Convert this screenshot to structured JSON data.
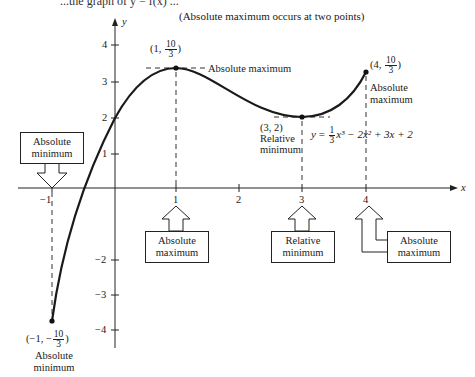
{
  "caption_cropped": "...the graph of y = f(x) ...",
  "note": "(Absolute maximum occurs at two points)",
  "axes": {
    "x_label": "x",
    "y_label": "y",
    "x_ticks": [
      "−1",
      "1",
      "2",
      "3",
      "4"
    ],
    "y_ticks": [
      "4",
      "3",
      "2",
      "1",
      "−2",
      "−3",
      "−4"
    ]
  },
  "equation": {
    "lhs": "y",
    "eq": "=",
    "coef_num": "1",
    "coef_den": "3",
    "rest": "x³ − 2x² + 3x + 2"
  },
  "points": [
    {
      "id": "left-endpoint",
      "x_text": "(−1, −",
      "num": "10",
      "den": "3",
      "close": ")",
      "label1": "Absolute",
      "label2": "minimum"
    },
    {
      "id": "local-max",
      "x_text": "(1, ",
      "num": "10",
      "den": "3",
      "close": ")",
      "label": "Absolute maximum"
    },
    {
      "id": "local-min",
      "coord": "(3, 2)",
      "label1": "Relative",
      "label2": "minimum"
    },
    {
      "id": "right-endpoint",
      "x_text": "(4, ",
      "num": "10",
      "den": "3",
      "close": ")",
      "label1": "Absolute",
      "label2": "maximum"
    }
  ],
  "callouts": [
    {
      "line1": "Absolute",
      "line2": "minimum",
      "at_x": "−1"
    },
    {
      "line1": "Absolute",
      "line2": "maximum",
      "at_x": "1"
    },
    {
      "line1": "Relative",
      "line2": "minimum",
      "at_x": "3"
    },
    {
      "line1": "Absolute",
      "line2": "maximum",
      "at_x": "4"
    }
  ],
  "colors": {
    "ink": "#1a1a1a",
    "background": "#ffffff"
  }
}
